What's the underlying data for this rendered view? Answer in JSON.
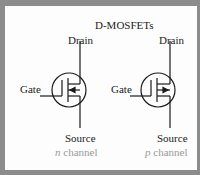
{
  "title": "D-MOSFETs",
  "symbols": [
    {
      "type": "n-channel",
      "drain": "Drain",
      "gate": "Gate",
      "source": "Source",
      "channel_letter": "n",
      "channel_word": "channel",
      "arrow": "inward"
    },
    {
      "type": "p-channel",
      "drain": "Drain",
      "gate": "Gate",
      "source": "Source",
      "channel_letter": "p",
      "channel_word": "channel",
      "arrow": "outward"
    }
  ],
  "colors": {
    "border": "#8c8c8c",
    "background": "#fdfdfd",
    "stroke": "#1a1a1a",
    "caption": "#9a9a9a"
  }
}
